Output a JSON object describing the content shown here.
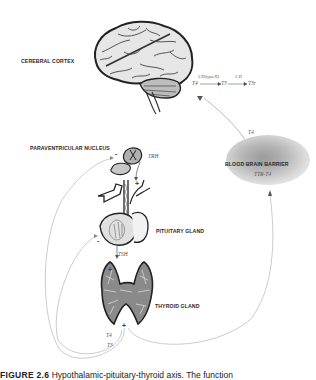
{
  "diagram": {
    "type": "hypothalamic-pituitary-thyroid axis",
    "labels": {
      "cerebral_cortex": "CEREBRAL CORTEX",
      "paraventricular_nucleus": "PARAVENTRICULAR NUCLEUS",
      "pituitary_gland": "PITUITARY GLAND",
      "thyroid_gland": "THYROID GLAND",
      "blood_brain_barrier": "BLOOD BRAIN BARRIER"
    },
    "hormones": {
      "trh": "TRH",
      "tsh": "TSH",
      "t4_thyroid": "T4",
      "t3_thyroid": "T3",
      "ttr_t4": "TTR-T4",
      "t4_to_brain": "T4"
    },
    "conversion": {
      "enzyme_1": "5'D(type II)",
      "enzyme_2": "5 D",
      "step_1": "T4",
      "step_2": "T3",
      "step_3": "T3r"
    },
    "signs": {
      "pvn_feedback": "-",
      "trh_stimulation": "+",
      "pituitary_feedback": "-",
      "tsh_stimulation": "+",
      "thyroid_output": "+"
    }
  },
  "caption": {
    "figure_number": "FIGURE 2.6",
    "text": "Hypothalamic-pituitary-thyroid axis. The function"
  }
}
